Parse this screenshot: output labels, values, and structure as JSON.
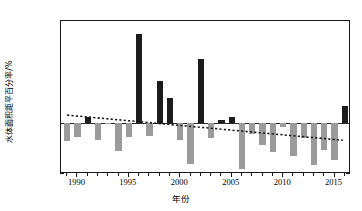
{
  "chart_data": {
    "type": "bar",
    "title": "",
    "subtitle": "",
    "xlabel": "年份",
    "ylabel": "水体面积距平百分率/%",
    "xlim": [
      1988.4,
      2016.6
    ],
    "ylim": [
      -40,
      80
    ],
    "ytick_values": [
      -40,
      -20,
      0,
      20,
      40,
      60,
      80
    ],
    "ytick_labels": [
      "−40",
      "−20",
      "0",
      "20",
      "40",
      "60",
      "80"
    ],
    "xtick_values": [
      1990,
      1995,
      2000,
      2005,
      2010,
      2015
    ],
    "xtick_labels": [
      "1990",
      "1995",
      "2000",
      "2005",
      "2010",
      "2015"
    ],
    "y_minor_interval": 10,
    "x_minor_interval": 1,
    "grid": false,
    "legend": null,
    "categories": [
      1989,
      1990,
      1991,
      1992,
      1993,
      1994,
      1995,
      1996,
      1997,
      1998,
      1999,
      2000,
      2001,
      2002,
      2003,
      2004,
      2005,
      2006,
      2007,
      2008,
      2009,
      2010,
      2011,
      2012,
      2013,
      2014,
      2015,
      2016
    ],
    "values": [
      -14,
      -11,
      5,
      -13,
      -1,
      -22,
      -11,
      70,
      -10,
      33,
      20,
      -13,
      -32,
      50,
      -12,
      2,
      5,
      -36,
      -9,
      -17,
      -23,
      -3,
      -26,
      -12,
      -33,
      -21,
      -29,
      13
    ],
    "bar_colors": {
      "positive": "#1c1c1c",
      "negative": "#9b9b9b"
    },
    "series": [
      {
        "name": "水体面积距平百分率",
        "values": [
          -14,
          -11,
          5,
          -13,
          -1,
          -22,
          -11,
          70,
          -10,
          33,
          20,
          -13,
          -32,
          50,
          -12,
          2,
          5,
          -36,
          -9,
          -17,
          -23,
          -3,
          -26,
          -12,
          -33,
          -21,
          -29,
          13
        ]
      },
      {
        "name": "线性趋势线",
        "type": "line",
        "style": "dotted",
        "color": "#1a1a1a",
        "x": [
          1989,
          2016
        ],
        "values": [
          5.2,
          -14.8
        ]
      }
    ],
    "annotations": []
  }
}
